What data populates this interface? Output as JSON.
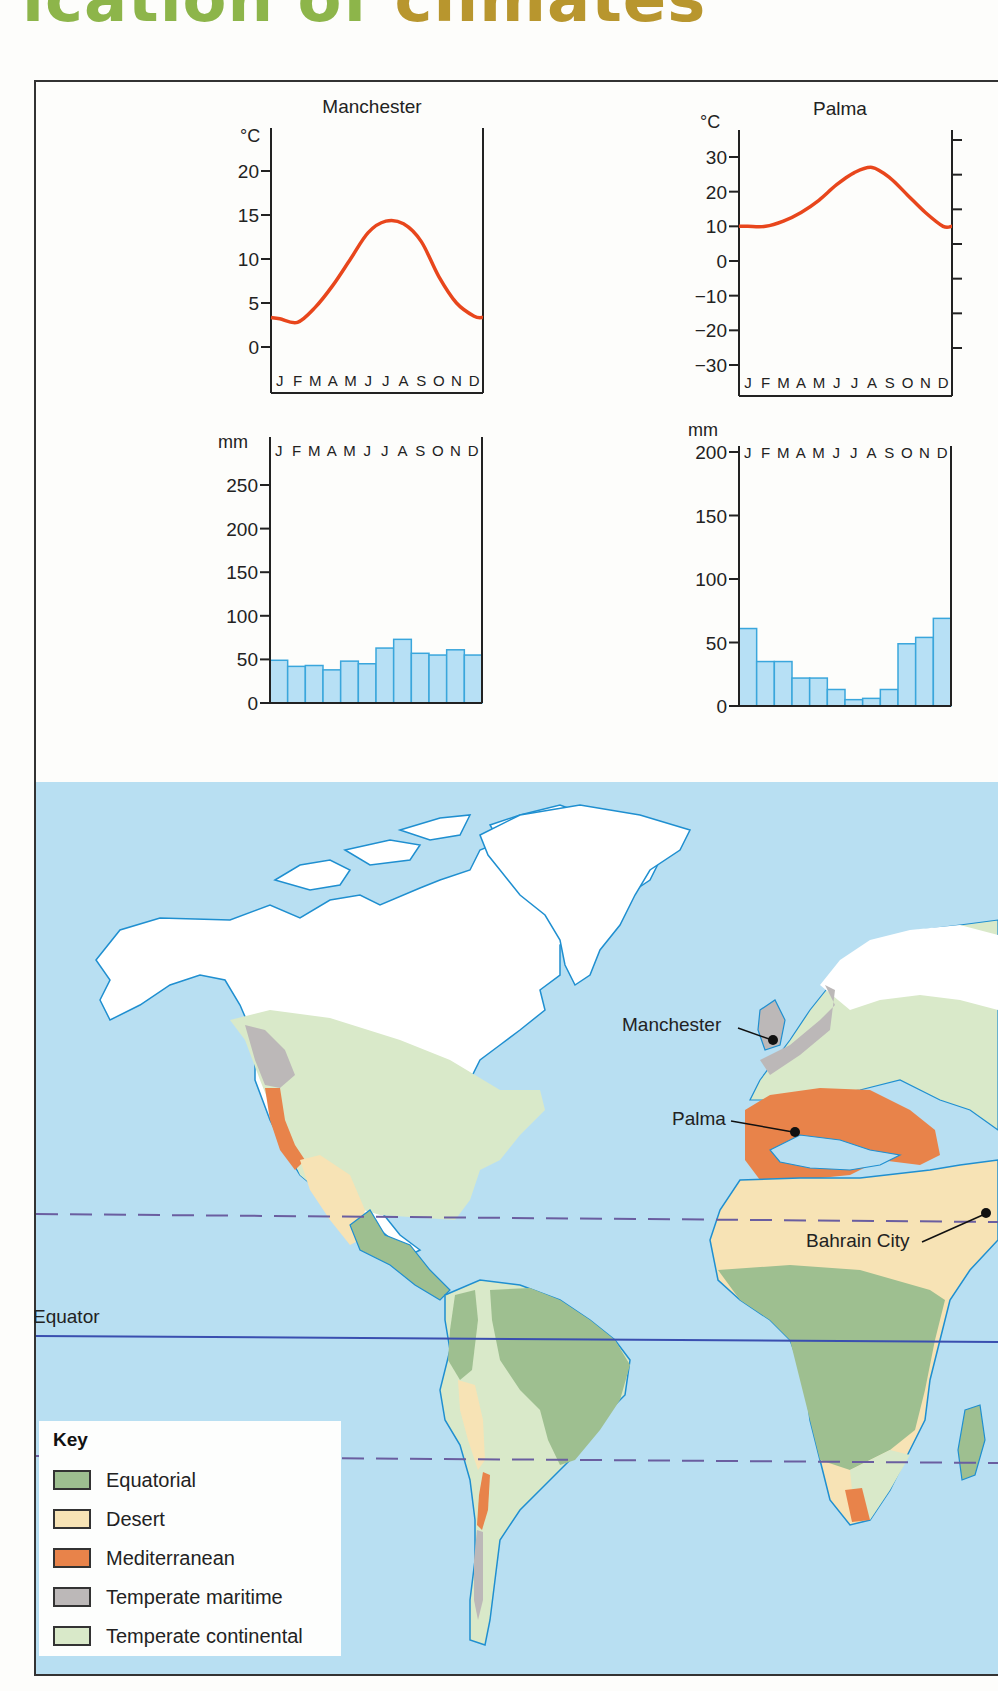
{
  "page": {
    "title_part1": "ication of",
    "title_part2": "climates",
    "title_colors": {
      "part1": "#8db54a",
      "part2": "#b8962e"
    }
  },
  "months": [
    "J",
    "F",
    "M",
    "A",
    "M",
    "J",
    "J",
    "A",
    "S",
    "O",
    "N",
    "D"
  ],
  "colors": {
    "temperature_line": "#e8461c",
    "precip_bar_fill": "#b7e0f5",
    "precip_bar_stroke": "#3aa6dc",
    "ocean": "#b8dff2",
    "coast": "#1f8fd0",
    "ice_land": "#ffffff",
    "equatorial": "#9ebf90",
    "desert": "#f7e3b5",
    "mediterranean": "#e8834a",
    "temperate_maritime": "#bcb8b8",
    "temperate_continental": "#d9e9c9",
    "tropic_line": "#6a5ea0",
    "equator_line": "#3a4fb0"
  },
  "chart_data": [
    {
      "type": "line",
      "title": "Manchester",
      "ylabel": "°C",
      "xlabel": "",
      "categories": [
        "J",
        "F",
        "M",
        "A",
        "M",
        "J",
        "J",
        "A",
        "S",
        "O",
        "N",
        "D"
      ],
      "values": [
        3.2,
        2.8,
        4.5,
        7,
        10,
        13,
        14.3,
        14,
        12,
        8,
        5,
        3.5
      ],
      "ylim": [
        -2,
        24
      ],
      "yticks": [
        0,
        5,
        10,
        15,
        20
      ],
      "ytick_labels": [
        "0",
        "5",
        "10",
        "15",
        "20"
      ],
      "grid": false
    },
    {
      "type": "line",
      "title": "Palma",
      "ylabel": "°C",
      "xlabel": "",
      "categories": [
        "J",
        "F",
        "M",
        "A",
        "M",
        "J",
        "J",
        "A",
        "S",
        "O",
        "N",
        "D"
      ],
      "values": [
        10,
        10,
        11.5,
        14,
        17.5,
        22,
        25.5,
        27,
        24,
        19,
        14,
        10
      ],
      "ylim": [
        -32,
        36
      ],
      "yticks": [
        30,
        20,
        10,
        0,
        -10,
        -20,
        -30
      ],
      "ytick_labels": [
        "30",
        "20",
        "10",
        "0",
        "−10",
        "−20",
        "−30"
      ],
      "grid": false
    },
    {
      "type": "bar",
      "title": "Manchester",
      "ylabel": "mm",
      "xlabel": "",
      "categories": [
        "J",
        "F",
        "M",
        "A",
        "M",
        "J",
        "J",
        "A",
        "S",
        "O",
        "N",
        "D"
      ],
      "values": [
        49,
        42,
        43,
        38,
        48,
        45,
        63,
        73,
        57,
        55,
        61,
        55
      ],
      "ylim": [
        0,
        280
      ],
      "yticks": [
        0,
        50,
        100,
        150,
        200,
        250
      ],
      "ytick_labels": [
        "0",
        "50",
        "100",
        "150",
        "200",
        "250"
      ],
      "grid": false
    },
    {
      "type": "bar",
      "title": "Palma",
      "ylabel": "mm",
      "xlabel": "",
      "categories": [
        "J",
        "F",
        "M",
        "A",
        "M",
        "J",
        "J",
        "A",
        "S",
        "O",
        "N",
        "D"
      ],
      "values": [
        61,
        35,
        35,
        22,
        22,
        13,
        5,
        6,
        13,
        49,
        54,
        69
      ],
      "ylim": [
        0,
        200
      ],
      "yticks": [
        0,
        50,
        100,
        150,
        200
      ],
      "ytick_labels": [
        "0",
        "50",
        "100",
        "150",
        "200"
      ],
      "grid": false
    }
  ],
  "map": {
    "equator_label": "Equator",
    "places": [
      {
        "name": "Manchester"
      },
      {
        "name": "Palma"
      },
      {
        "name": "Bahrain City"
      }
    ]
  },
  "key": {
    "title": "Key",
    "items": [
      {
        "label": "Equatorial",
        "color": "#9ebf90"
      },
      {
        "label": "Desert",
        "color": "#f7e3b5"
      },
      {
        "label": "Mediterranean",
        "color": "#e8834a"
      },
      {
        "label": "Temperate maritime",
        "color": "#bcb8b8"
      },
      {
        "label": "Temperate continental",
        "color": "#d9e9c9"
      }
    ]
  }
}
